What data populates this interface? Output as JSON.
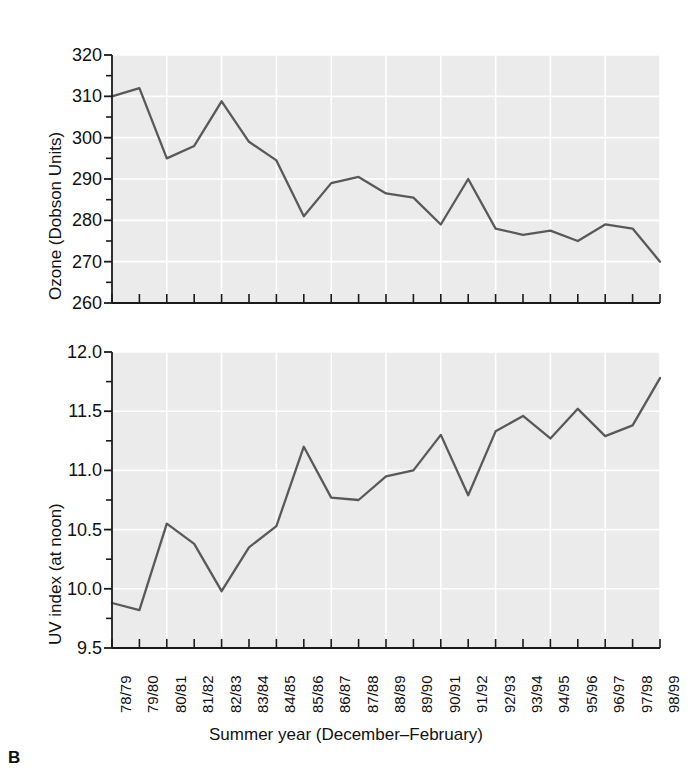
{
  "figure": {
    "panel_label": "B",
    "xlabel": "Summer year (December–February)",
    "background_color": "#ebebeb",
    "gridline_color": "#ffffff",
    "line_color": "#595959",
    "axis_color": "#1a1a1a"
  },
  "chart_data": [
    {
      "type": "line",
      "title": "",
      "ylabel": "Ozone (Dobson Units)",
      "xlabel": "Summer year (December–February)",
      "ylim": [
        260,
        320
      ],
      "yticks": [
        260,
        270,
        280,
        290,
        300,
        310,
        320
      ],
      "ytick_labels": [
        "260",
        "270",
        "280",
        "290",
        "300",
        "310",
        "320"
      ],
      "minor_ytick_step": 5,
      "grid": true,
      "legend": "none",
      "categories": [
        "78/79",
        "79/80",
        "80/81",
        "81/82",
        "82/83",
        "83/84",
        "84/85",
        "85/86",
        "86/87",
        "87/88",
        "88/89",
        "89/90",
        "90/91",
        "91/92",
        "92/93",
        "93/94",
        "94/95",
        "95/96",
        "96/97",
        "97/98",
        "98/99"
      ],
      "values": [
        310.0,
        312.0,
        295.0,
        298.0,
        308.8,
        299.0,
        294.5,
        281.0,
        289.0,
        290.5,
        286.5,
        285.5,
        279.0,
        290.0,
        278.0,
        276.5,
        277.5,
        275.0,
        279.0,
        278.0,
        270.0
      ]
    },
    {
      "type": "line",
      "title": "",
      "ylabel": "UV index (at noon)",
      "xlabel": "Summer year (December–February)",
      "ylim": [
        9.5,
        12.0
      ],
      "yticks": [
        9.5,
        10.0,
        10.5,
        11.0,
        11.5,
        12.0
      ],
      "ytick_labels": [
        "9.5",
        "10.0",
        "10.5",
        "11.0",
        "11.5",
        "12.0"
      ],
      "minor_ytick_step": 0.25,
      "grid": true,
      "legend": "none",
      "categories": [
        "78/79",
        "79/80",
        "80/81",
        "81/82",
        "82/83",
        "83/84",
        "84/85",
        "85/86",
        "86/87",
        "87/88",
        "88/89",
        "89/90",
        "90/91",
        "91/92",
        "92/93",
        "93/94",
        "94/95",
        "95/96",
        "96/97",
        "97/98",
        "98/99"
      ],
      "values": [
        9.88,
        9.82,
        10.55,
        10.38,
        9.98,
        10.35,
        10.53,
        11.2,
        10.77,
        10.75,
        10.95,
        11.0,
        11.3,
        10.79,
        11.33,
        11.46,
        11.27,
        11.52,
        11.29,
        11.38,
        11.78
      ]
    }
  ]
}
